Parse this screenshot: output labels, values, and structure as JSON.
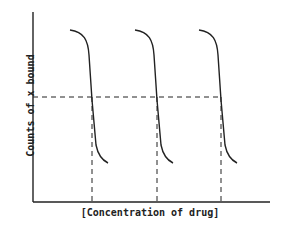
{
  "diagram": {
    "ylabel": "Counts of x bound",
    "xlabel": "[Concentration of drug]",
    "curves": 3,
    "line_color": "#222222"
  }
}
